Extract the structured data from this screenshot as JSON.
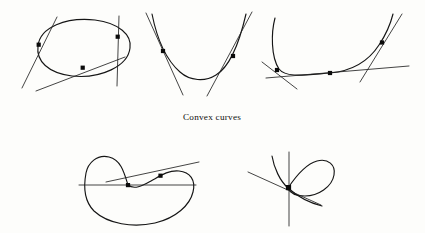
{
  "page": {
    "background_color": "#fdfdfb",
    "ink_color": "#151515",
    "width": 425,
    "height": 233
  },
  "caption": {
    "text": "Convex curves",
    "x": 212,
    "y": 120
  },
  "figures": [
    {
      "id": "figure-ellipse",
      "name": "tilted-ellipse-with-three-tangents",
      "row": "top",
      "position": 1,
      "curve_type": "closed convex oval",
      "tangent_count": 3,
      "tangent_point_count": 3,
      "tangent_points": [
        {
          "x": 40,
          "y": 45
        },
        {
          "x": 118,
          "y": 37
        },
        {
          "x": 83,
          "y": 68
        }
      ]
    },
    {
      "id": "figure-parabola",
      "name": "u-shaped-convex-curve-with-two-tangents",
      "row": "top",
      "position": 2,
      "curve_type": "open convex U curve",
      "tangent_count": 2,
      "tangent_point_count": 2,
      "tangent_points": [
        {
          "x": 163,
          "y": 51
        },
        {
          "x": 233,
          "y": 56
        }
      ]
    },
    {
      "id": "figure-flatbottom",
      "name": "flat-bottomed-convex-curve-with-three-tangents",
      "row": "top",
      "position": 3,
      "curve_type": "open convex curve with flat segment",
      "tangent_count": 3,
      "tangent_point_count": 3,
      "tangent_points": [
        {
          "x": 277,
          "y": 70
        },
        {
          "x": 330,
          "y": 73
        },
        {
          "x": 382,
          "y": 42
        }
      ]
    },
    {
      "id": "figure-bean",
      "name": "non-convex-bean-curve-with-two-tangents",
      "row": "bottom",
      "position": 1,
      "curve_type": "closed non-convex (bean) curve",
      "tangent_count": 2,
      "tangent_point_count": 2,
      "tangent_points": [
        {
          "x": 127,
          "y": 185
        },
        {
          "x": 160,
          "y": 176
        }
      ]
    },
    {
      "id": "figure-node",
      "name": "self-intersecting-looped-curve-with-node",
      "row": "bottom",
      "position": 2,
      "curve_type": "self-intersecting curve with node",
      "tangent_count": 2,
      "tangent_point_count": 1,
      "tangent_points": [
        {
          "x": 288,
          "y": 188
        }
      ]
    }
  ]
}
